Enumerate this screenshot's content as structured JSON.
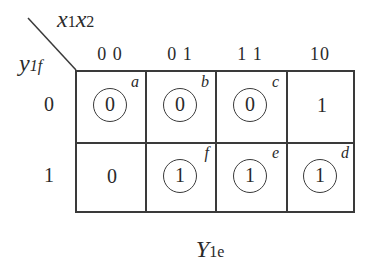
{
  "diagram": {
    "type": "karnaugh-map",
    "title": {
      "main": "Y",
      "sub": "1e"
    },
    "corner": {
      "col_var": {
        "x1": "x",
        "x1_sub": "1",
        "x2": "x",
        "x2_sub": "2"
      },
      "row_var": {
        "main": "y",
        "sub": "1f"
      }
    },
    "column_headers": [
      "0 0",
      "0 1",
      "1 1",
      "10"
    ],
    "row_headers": [
      "0",
      "1"
    ],
    "rows": [
      [
        {
          "value": "0",
          "circled": true,
          "label": "a"
        },
        {
          "value": "0",
          "circled": true,
          "label": "b"
        },
        {
          "value": "0",
          "circled": true,
          "label": "c"
        },
        {
          "value": "1",
          "circled": false,
          "label": ""
        }
      ],
      [
        {
          "value": "0",
          "circled": false,
          "label": ""
        },
        {
          "value": "1",
          "circled": true,
          "label": "f"
        },
        {
          "value": "1",
          "circled": true,
          "label": "e"
        },
        {
          "value": "1",
          "circled": true,
          "label": "d"
        }
      ]
    ]
  }
}
